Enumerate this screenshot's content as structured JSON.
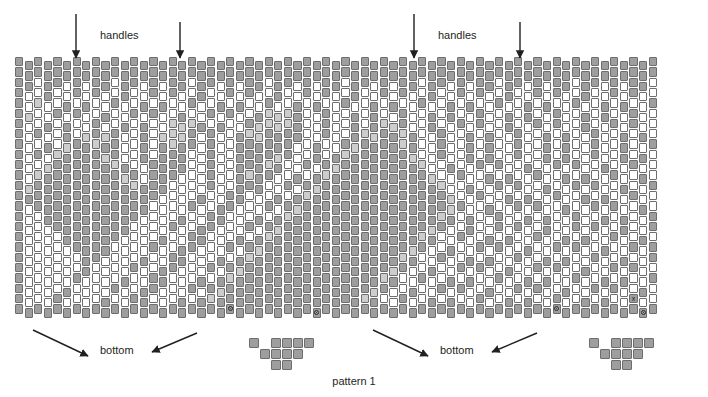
{
  "figure": {
    "caption": "pattern 1",
    "type": "brick-stitch beading pattern chart",
    "top_labels": [
      {
        "text": "handles",
        "x": 100,
        "y": 29
      },
      {
        "text": "handles",
        "x": 438,
        "y": 29
      }
    ],
    "bottom_labels": [
      {
        "text": "bottom",
        "x": 100,
        "y": 344
      },
      {
        "text": "bottom",
        "x": 440,
        "y": 344
      }
    ],
    "top_arrows": [
      {
        "x": 76,
        "y1": 14,
        "y2": 58
      },
      {
        "x": 180,
        "y1": 22,
        "y2": 58
      },
      {
        "x": 414,
        "y1": 14,
        "y2": 58
      },
      {
        "x": 520,
        "y1": 22,
        "y2": 58
      }
    ],
    "bottom_arrows": [
      {
        "x1": 33,
        "y1": 330,
        "x2": 88,
        "y2": 356
      },
      {
        "x1": 197,
        "y1": 333,
        "x2": 152,
        "y2": 352
      },
      {
        "x1": 373,
        "y1": 330,
        "x2": 428,
        "y2": 356
      },
      {
        "x1": 537,
        "y1": 333,
        "x2": 492,
        "y2": 352
      }
    ],
    "markers": [
      {
        "glyph": "circle",
        "col": 22,
        "row": 24
      },
      {
        "glyph": "circle",
        "col": 31,
        "row": 24
      },
      {
        "glyph": "circle",
        "col": 56,
        "row": 24
      },
      {
        "glyph": "x",
        "col": 64,
        "row": 23
      },
      {
        "glyph": "circle",
        "col": 65,
        "row": 24
      }
    ]
  },
  "palette": {
    "dark_gray": "#9e9e9e",
    "light_gray": "#cdcdcd",
    "white": "#ffffff",
    "outline": "#6d6d6d",
    "text": "#231f20"
  },
  "grid": {
    "columns": 67,
    "rows": 25,
    "cell_width": 9.6,
    "cell_height": 10.3,
    "bead_width": 8.2,
    "bead_height": 9.4,
    "origin_x": 15,
    "origin_y": 61,
    "offset_odd_columns": -4,
    "legend": {
      "1": "dark_gray",
      "2": "light_gray",
      "0": "white"
    },
    "rows_data": [
      "1111111111111111111111111111111111111111111111111111111111111111111",
      "1111111111111111111111111111111111111111111111111111111111111111111",
      "1101101011011010110110101101101011011010110110101101101011011010110",
      "1001001010010010100100101001001010010010100100101001001010010010100",
      "1020010100100101001001010010010100100101001001010010010100100101001",
      "1200101001001010010010100122210010010100100101001001010010010100100",
      "1001010010010100222101001222210010010122100100101001001010010010100",
      "1010010212100102221010012211110010012211210010010100100101001001010",
      "1001021121100101211010011111100100121111210010010100100101001001001",
      "1010211112100101110010011112100101211111120010010100100101001001010",
      "1002111111210011110010011121001012111111112001001010010010100100100",
      "1021111111121011100010012110010121111111111200100101001001010010010",
      "1211111111112111000010011100101211111111111120010010100100101001001",
      "1111111111111110000100110001012111111111111112001001010010010100100",
      "1011111111111100001001100010121111111111111112100100101001001010010",
      "1001111111111000010011000101211111111111111121010010010100100101001",
      "1000111111110000100110001012111111111111111210010010100100101001001",
      "1000011111100001001100010121111111111111112100100101001001010010010",
      "1000001111000010011000101211111111111111121001001010010010100100101",
      "1000000110000100110001012111111111111111210010010100100101001001001",
      "1000000100001001100010121111111111111112100100101001001010010010100",
      "1000001000010011000101211111111111111121001001010010010100100101001",
      "1000010000100110001012111111111111111210010010100100101001001010010",
      "1000100001001100010121111111111111112100100101001001010010010100100",
      "1111111111111111111111111111111111111111111111111111111111111111111"
    ]
  },
  "fringe": {
    "description": "triangular fringe motifs below the chart",
    "cell_width": 11,
    "cell_height": 11,
    "groups": [
      {
        "origin_x": 249,
        "origin_y": 338,
        "beads": [
          {
            "col": 0,
            "row": 0
          },
          {
            "col": 1,
            "row": 1
          },
          {
            "col": 2,
            "row": 1
          },
          {
            "col": 2,
            "row": 0
          },
          {
            "col": 3,
            "row": 0
          },
          {
            "col": 3,
            "row": 1
          },
          {
            "col": 4,
            "row": 1
          },
          {
            "col": 2,
            "row": 2
          },
          {
            "col": 3,
            "row": 2
          },
          {
            "col": 4,
            "row": 0
          },
          {
            "col": 5,
            "row": 0
          }
        ]
      },
      {
        "origin_x": 589,
        "origin_y": 338,
        "beads": [
          {
            "col": 0,
            "row": 0
          },
          {
            "col": 1,
            "row": 1
          },
          {
            "col": 2,
            "row": 1
          },
          {
            "col": 2,
            "row": 0
          },
          {
            "col": 3,
            "row": 0
          },
          {
            "col": 3,
            "row": 1
          },
          {
            "col": 4,
            "row": 1
          },
          {
            "col": 2,
            "row": 2
          },
          {
            "col": 3,
            "row": 2
          },
          {
            "col": 4,
            "row": 0
          },
          {
            "col": 5,
            "row": 0
          }
        ]
      }
    ]
  }
}
